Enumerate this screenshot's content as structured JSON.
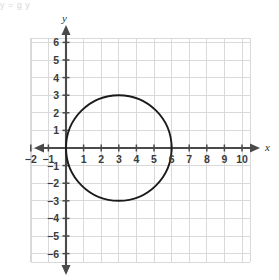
{
  "page": {
    "top_cut_text": "y  =          g   y",
    "background": "#ffffff"
  },
  "figure": {
    "name": "coordinate-plane-circle-graph",
    "axis_label_x": "x",
    "axis_label_y": "y"
  },
  "colors": {
    "grid": "#d9d9d9",
    "axis": "#4a4a4a",
    "curve": "#1b1b1b",
    "tick_text": "#3b3b3b"
  },
  "chart_data": {
    "type": "scatter",
    "title": "",
    "xlabel": "x",
    "ylabel": "y",
    "xlim": [
      -2.5,
      10.5
    ],
    "ylim": [
      -6.5,
      6.5
    ],
    "grid": true,
    "legend": "none",
    "x_ticks": [
      -2,
      -1,
      1,
      2,
      3,
      4,
      5,
      6,
      7,
      8,
      9,
      10
    ],
    "x_tick_labels": [
      "−2",
      "−1",
      "1",
      "2",
      "3",
      "4",
      "5",
      "6",
      "7",
      "8",
      "9",
      "10"
    ],
    "y_ticks": [
      6,
      5,
      4,
      3,
      2,
      1,
      -1,
      -2,
      -3,
      -4,
      -5,
      -6
    ],
    "y_tick_labels": [
      "6",
      "5",
      "4",
      "3",
      "2",
      "1",
      "−1",
      "−2",
      "−3",
      "−4",
      "−5",
      "−6"
    ],
    "series": [
      {
        "name": "circle",
        "shape": "circle",
        "center": [
          3,
          0
        ],
        "radius": 3,
        "equation": "(x - 3)^2 + y^2 = 9",
        "key_points": [
          [
            0,
            0
          ],
          [
            6,
            0
          ],
          [
            3,
            3
          ],
          [
            3,
            -3
          ]
        ]
      }
    ]
  },
  "geometry": {
    "origin_px": [
      66,
      148
    ],
    "unit_px": 17.6,
    "grid_bounds_px": {
      "left": 31,
      "right": 250,
      "top": 38,
      "bottom": 262
    },
    "x_axis_arrow_left_px": 36,
    "x_axis_arrow_right_px": 258,
    "y_axis_arrow_top_px": 26,
    "y_axis_arrow_bottom_px": 274
  }
}
